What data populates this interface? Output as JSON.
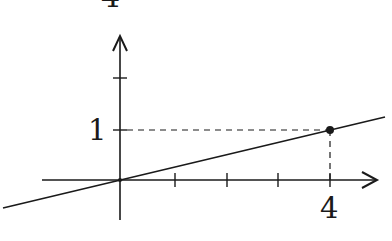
{
  "figure": {
    "type": "coordinate-diagram",
    "colors": {
      "ink": "#1a1a1a",
      "background": "#ffffff"
    },
    "labels": {
      "top_cut": "4",
      "y_value": "1",
      "x_value": "4"
    },
    "axes": {
      "x": {
        "ticks": [
          1,
          2,
          3,
          4
        ],
        "arrow": true
      },
      "y": {
        "ticks": [
          1,
          2
        ],
        "arrow": true
      }
    },
    "line": {
      "description": "line through origin with slope 1/4",
      "passes_through": [
        [
          0,
          0
        ],
        [
          4,
          1
        ]
      ]
    },
    "point": {
      "x": 4,
      "y": 1,
      "marked": true
    },
    "guides": {
      "style": "dashed",
      "from_point_to_axes": true
    }
  }
}
